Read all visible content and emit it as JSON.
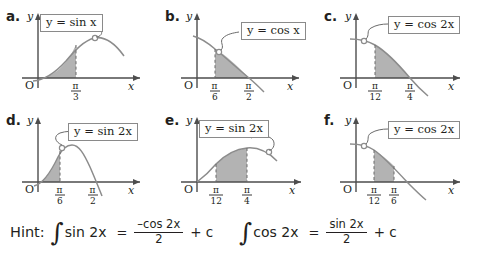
{
  "document": {
    "kind": "math-worksheet-figure",
    "background_color": "#ffffff",
    "ink_color": "#231f20",
    "shade_color": "#b3b3b3",
    "curve_color": "#8c8c8c",
    "box_border_color": "#8a8a8a"
  },
  "panels": [
    {
      "id": "a",
      "letter": "a.",
      "label": "y = sin x",
      "function": "sin(x)",
      "y_axis_label": "y",
      "x_axis_label": "x",
      "origin_label": "O",
      "ticks": [
        {
          "num": "π",
          "den": "3"
        }
      ],
      "shaded_from": "0",
      "shaded_to": "π/3",
      "callout_position": "upper-left"
    },
    {
      "id": "b",
      "letter": "b.",
      "label": "y = cos x",
      "function": "cos(x)",
      "y_axis_label": "y",
      "x_axis_label": "x",
      "origin_label": "O",
      "ticks": [
        {
          "num": "π",
          "den": "6"
        },
        {
          "num": "π",
          "den": "2"
        }
      ],
      "shaded_from": "π/6",
      "shaded_to": "π/2",
      "callout_position": "upper-right"
    },
    {
      "id": "c",
      "letter": "c.",
      "label": "y = cos 2x",
      "function": "cos(2x)",
      "y_axis_label": "y",
      "x_axis_label": "x",
      "origin_label": "O",
      "ticks": [
        {
          "num": "π",
          "den": "12"
        },
        {
          "num": "π",
          "den": "4"
        }
      ],
      "shaded_from": "π/12",
      "shaded_to": "π/4",
      "callout_position": "upper-right"
    },
    {
      "id": "d",
      "letter": "d.",
      "label": "y = sin 2x",
      "function": "sin(2x)",
      "y_axis_label": "y",
      "x_axis_label": "x",
      "origin_label": "O",
      "ticks": [
        {
          "num": "π",
          "den": "6"
        },
        {
          "num": "π",
          "den": "2"
        }
      ],
      "shaded_from": "0",
      "shaded_to": "π/6",
      "callout_position": "upper-right"
    },
    {
      "id": "e",
      "letter": "e.",
      "label": "y = sin 2x",
      "function": "sin(2x)",
      "y_axis_label": "y",
      "x_axis_label": "x",
      "origin_label": "O",
      "ticks": [
        {
          "num": "π",
          "den": "12"
        },
        {
          "num": "π",
          "den": "4"
        }
      ],
      "shaded_from": "π/12",
      "shaded_to": "π/4",
      "callout_position": "upper-left"
    },
    {
      "id": "f",
      "letter": "f.",
      "label": "y = cos 2x",
      "function": "cos(2x)",
      "y_axis_label": "y",
      "x_axis_label": "x",
      "origin_label": "O",
      "ticks": [
        {
          "num": "π",
          "den": "12"
        },
        {
          "num": "π",
          "den": "6"
        }
      ],
      "shaded_from": "π/12",
      "shaded_to": "π/6",
      "callout_position": "upper-right"
    }
  ],
  "hint": {
    "word": "Hint:",
    "equations": [
      {
        "integral_symbol": "∫",
        "integrand": "sin 2x",
        "equals": "=",
        "numerator": "–cos 2x",
        "denominator": "2",
        "tail": "+ c"
      },
      {
        "integral_symbol": "∫",
        "integrand": "cos 2x",
        "equals": "=",
        "numerator": "sin 2x",
        "denominator": "2",
        "tail": "+ c"
      }
    ]
  }
}
